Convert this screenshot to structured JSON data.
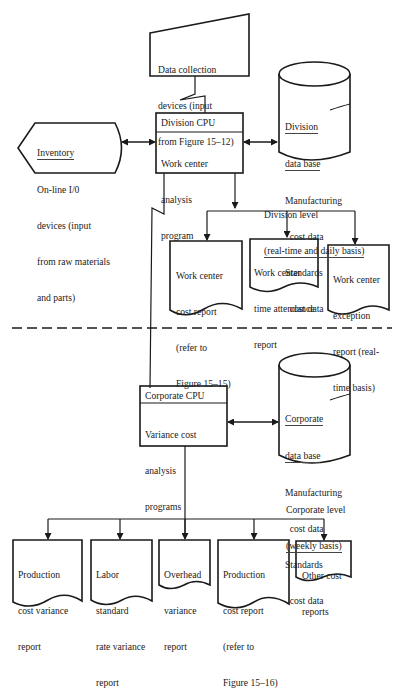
{
  "diagram": {
    "colors": {
      "stroke": "#1a1a1a",
      "text": "#222222",
      "background": "#ffffff"
    },
    "division": {
      "data_collection": [
        "Data collection",
        "devices (input",
        "from Figure 15–12)"
      ],
      "inventory": {
        "title": "Inventory",
        "lines": [
          "On-line I/0",
          "devices (input",
          "from raw materials",
          "and parts)"
        ]
      },
      "cpu": {
        "title": "Division CPU",
        "lines": [
          "Work center",
          "analysis",
          "program"
        ]
      },
      "database": {
        "title": [
          "Division",
          "data base"
        ],
        "lines": [
          "Manufacturing",
          "  cost data",
          "Standards",
          "  cost data"
        ]
      },
      "level_label": [
        "Division level",
        "(real-time and daily basis)"
      ],
      "reports": [
        {
          "lines": [
            "Work center",
            "cost report",
            "(refer to",
            "Figure 15–15)"
          ]
        },
        {
          "lines": [
            "Work center",
            "time attendance",
            "report"
          ]
        },
        {
          "lines": [
            "Work center",
            "exception",
            "report (real-",
            "time basis)"
          ]
        }
      ]
    },
    "corporate": {
      "cpu": {
        "title": "Corporate CPU",
        "lines": [
          "Variance cost",
          "analysis",
          "programs"
        ]
      },
      "database": {
        "title": [
          "Corporate",
          "data base"
        ],
        "lines": [
          "Manufacturing",
          "  cost data",
          "Standards",
          "  cost data"
        ]
      },
      "level_label": [
        "Corporate level",
        "(weekly basis)"
      ],
      "reports": [
        {
          "lines": [
            "Production",
            "cost variance",
            "report"
          ]
        },
        {
          "lines": [
            "Labor",
            "standard",
            "rate variance",
            "report"
          ]
        },
        {
          "lines": [
            "Overhead",
            "variance",
            "report"
          ]
        },
        {
          "lines": [
            "Production",
            "cost report",
            "(refer to",
            "Figure 15–16)"
          ]
        },
        {
          "lines": [
            "Other cost",
            "reports"
          ]
        }
      ]
    }
  }
}
